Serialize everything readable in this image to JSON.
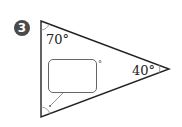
{
  "problem": {
    "number": "3",
    "angles": [
      {
        "vertex": "top-left",
        "label": "70°"
      },
      {
        "vertex": "right",
        "label": "40°"
      },
      {
        "vertex": "bottom-left",
        "label": "?",
        "answer_unit": "°"
      }
    ]
  },
  "colors": {
    "line": "#222222",
    "badge": "#4a4a4a",
    "box_border": "#666666"
  }
}
